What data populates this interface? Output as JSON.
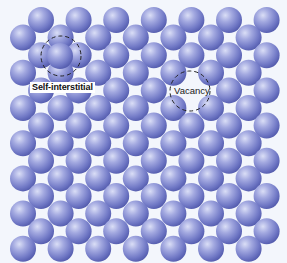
{
  "diagram": {
    "title": "",
    "colors": {
      "background": "#f3f6fc",
      "atom_highlight": "#d4d8f4",
      "atom_mid": "#8d94d6",
      "atom_shadow": "#555db0",
      "dashed_outline": "#222222"
    },
    "lattice": {
      "rows": 14,
      "atoms_per_row": 7,
      "atom_radius": 13,
      "even_row_x_start": 41,
      "odd_row_x_start": 23,
      "x_step": 37.6,
      "y_start": 20,
      "y_step": 17.6
    },
    "defects": {
      "self_interstitial": {
        "label": "Self-interstitial",
        "atom_center": [
          60,
          56
        ],
        "circle_center": [
          61,
          56
        ],
        "circle_radius": 20
      },
      "vacancy": {
        "label": "Vacancy",
        "missing_site": [
          189,
          90
        ],
        "circle_center": [
          190,
          91
        ],
        "circle_radius": 20
      }
    }
  }
}
